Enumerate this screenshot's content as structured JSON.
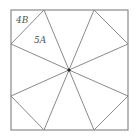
{
  "diagram": {
    "type": "geometric-figure",
    "stroke_color": "#8a8a8a",
    "center": {
      "x": 69,
      "y": 70
    },
    "square": {
      "x1": 11,
      "y1": 10,
      "x2": 128,
      "y2": 130
    },
    "edge_points": [
      {
        "x": 44,
        "y": 10
      },
      {
        "x": 94,
        "y": 10
      },
      {
        "x": 128,
        "y": 44
      },
      {
        "x": 128,
        "y": 96
      },
      {
        "x": 94,
        "y": 130
      },
      {
        "x": 44,
        "y": 130
      },
      {
        "x": 11,
        "y": 96
      },
      {
        "x": 11,
        "y": 44
      }
    ],
    "labels": [
      {
        "text": "4B",
        "x": 16,
        "y": 23
      },
      {
        "text": "5A",
        "x": 34,
        "y": 43
      }
    ]
  }
}
